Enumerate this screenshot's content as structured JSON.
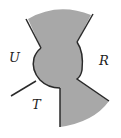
{
  "diagram": {
    "labels": {
      "U": "U",
      "R": "R",
      "T": "T"
    },
    "colors": {
      "fill": "#a8a8a8",
      "stroke": "#2a2a2a",
      "background": "#ffffff"
    }
  }
}
